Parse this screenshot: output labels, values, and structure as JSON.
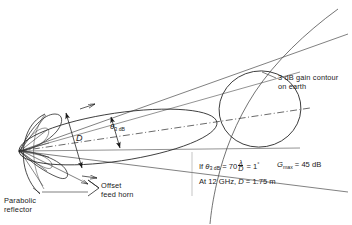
{
  "figure": {
    "background_color": "#ffffff",
    "ink_color": "#1a1a1a"
  },
  "labels": {
    "gain_contour": "3 dB gain contour\non earth",
    "offset_feed_horn": "Offset\nfeed horn",
    "parabolic_reflector": "Parabolic\nreflector",
    "beamwidth_symbol": "θ",
    "beamwidth_subscript": "3 dB",
    "aperture_diameter": "D"
  },
  "annotations": {
    "formula_prefix": "If ",
    "theta_symbol": "θ",
    "theta_subscript": "3 dB",
    "equals": " = ",
    "coefficient": "70",
    "fraction_numerator": "λ",
    "fraction_denominator": "D",
    "result": " = 1",
    "degree_symbol": "°",
    "gain_symbol": "G",
    "gain_subscript": "max",
    "gain_equals": " = ",
    "gain_value": "45 dB",
    "second_line_prefix": "At 12 GHz, ",
    "diameter_symbol": "D",
    "diameter_equals": " = ",
    "diameter_value": "1.75 m"
  },
  "geometry": {
    "frequency": "12 GHz",
    "beamwidth_deg": 1,
    "max_gain_db": 45,
    "reflector_diameter_m": 1.75,
    "beamwidth_coefficient": 70
  }
}
